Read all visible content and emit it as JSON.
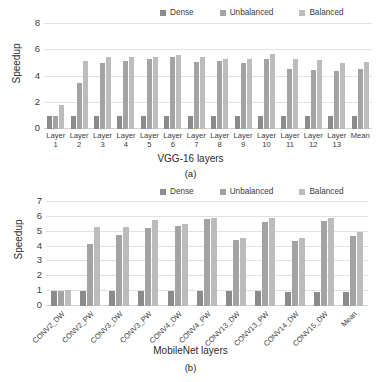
{
  "figures": [
    {
      "id": "a",
      "caption": "(a)",
      "legend": [
        {
          "label": "Dense",
          "color": "#8b8b8b"
        },
        {
          "label": "Unbalanced",
          "color": "#a3a3a3"
        },
        {
          "label": "Balanced",
          "color": "#bcbcbc"
        }
      ],
      "chart_data": {
        "type": "bar",
        "title": "",
        "xlabel": "VGG-16 layers",
        "ylabel": "Speedup",
        "ylim": [
          0,
          8
        ],
        "yticks": [
          0,
          2,
          4,
          6,
          8
        ],
        "grid": true,
        "legend_position": "top",
        "categories": [
          "Layer 1",
          "Layer 2",
          "Layer 3",
          "Layer 4",
          "Layer 5",
          "Layer 6",
          "Layer 7",
          "Layer 8",
          "Layer 9",
          "Layer 10",
          "Layer 11",
          "Layer 12",
          "Layer 13",
          "Mean"
        ],
        "category_lines": [
          [
            "Layer",
            "1"
          ],
          [
            "Layer",
            "2"
          ],
          [
            "Layer",
            "3"
          ],
          [
            "Layer",
            "4"
          ],
          [
            "Layer",
            "5"
          ],
          [
            "Layer",
            "6"
          ],
          [
            "Layer",
            "7"
          ],
          [
            "Layer",
            "8"
          ],
          [
            "Layer",
            "9"
          ],
          [
            "Layer",
            "10"
          ],
          [
            "Layer",
            "11"
          ],
          [
            "Layer",
            "12"
          ],
          [
            "Layer",
            "13"
          ],
          [
            "Mean",
            ""
          ]
        ],
        "series": [
          {
            "name": "Dense",
            "color": "#8b8b8b",
            "values": [
              1.0,
              1.0,
              1.0,
              1.0,
              1.0,
              1.0,
              1.0,
              1.0,
              1.0,
              1.0,
              1.0,
              1.0,
              1.0,
              1.0
            ]
          },
          {
            "name": "Unbalanced",
            "color": "#a3a3a3",
            "values": [
              1.0,
              3.5,
              5.0,
              5.15,
              5.35,
              5.5,
              5.1,
              5.2,
              5.0,
              5.35,
              4.6,
              4.5,
              4.45,
              4.6
            ]
          },
          {
            "name": "Balanced",
            "color": "#bcbcbc",
            "values": [
              1.85,
              5.15,
              5.45,
              5.45,
              5.5,
              5.65,
              5.45,
              5.3,
              5.35,
              5.7,
              5.35,
              5.25,
              5.0,
              5.1
            ]
          }
        ]
      }
    },
    {
      "id": "b",
      "caption": "(b)",
      "legend": [
        {
          "label": "Dense",
          "color": "#8b8b8b"
        },
        {
          "label": "Unbalanced",
          "color": "#a3a3a3"
        },
        {
          "label": "Balanced",
          "color": "#bcbcbc"
        }
      ],
      "chart_data": {
        "type": "bar",
        "title": "",
        "xlabel": "MobileNet layers",
        "ylabel": "Speedup",
        "ylim": [
          0,
          7
        ],
        "yticks": [
          0,
          1,
          2,
          3,
          4,
          5,
          6,
          7
        ],
        "grid": true,
        "legend_position": "top",
        "categories": [
          "CONV2_DW",
          "CONV2_PW",
          "CONV3_DW",
          "CONV3_PW",
          "CONV4_DW",
          "CONV4_PW",
          "CONV13_DW",
          "CONV13_PW",
          "CONV14_DW",
          "CONV15_DW",
          "Mean"
        ],
        "series": [
          {
            "name": "Dense",
            "color": "#8b8b8b",
            "values": [
              1.0,
              1.0,
              1.0,
              1.0,
              1.0,
              1.0,
              1.0,
              1.0,
              0.95,
              0.95,
              0.95
            ]
          },
          {
            "name": "Unbalanced",
            "color": "#a3a3a3",
            "values": [
              1.0,
              4.2,
              4.75,
              5.25,
              5.4,
              5.85,
              4.45,
              5.65,
              4.4,
              5.75,
              4.7
            ]
          },
          {
            "name": "Balanced",
            "color": "#bcbcbc",
            "values": [
              1.1,
              5.35,
              5.35,
              5.8,
              5.5,
              5.95,
              4.55,
              5.9,
              4.6,
              5.95,
              5.0
            ]
          }
        ]
      }
    }
  ]
}
